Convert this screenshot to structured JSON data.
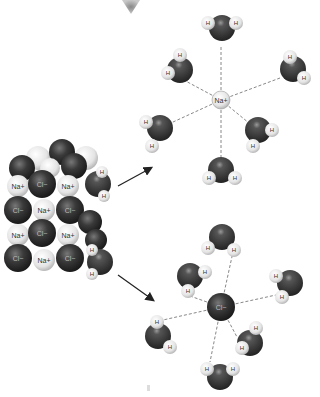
{
  "diagram": {
    "crystal": {
      "rows": [
        [
          "Na+",
          "Cl−",
          "Na+",
          "O"
        ],
        [
          "Cl−",
          "Na+",
          "Cl−"
        ],
        [
          "Na+",
          "Cl−",
          "Na+"
        ],
        [
          "Cl−",
          "Na+",
          "Cl−"
        ]
      ]
    },
    "hydrated_cation": {
      "label": "Na+",
      "water_count": 6,
      "water_atom_label": "H"
    },
    "hydrated_anion": {
      "label": "Cl−",
      "water_count": 6,
      "water_atom_label": "H"
    },
    "arrows": [
      "crystal-to-cation",
      "crystal-to-anion"
    ],
    "colors": {
      "chloride": "#2e2e2e",
      "sodium": "#e6e6e6",
      "oxygen": "#333333",
      "hydrogen": "#f2f2f2",
      "bond_line": "#888888"
    }
  },
  "labels": {
    "na": "Na+",
    "cl": "Cl−",
    "h": "H",
    "o": "O"
  }
}
